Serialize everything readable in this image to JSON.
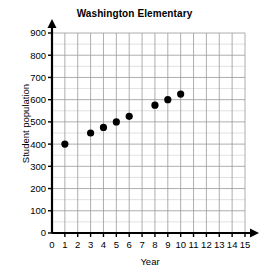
{
  "chart_data": {
    "type": "scatter",
    "title": "Washington Elementary",
    "xlabel": "Year",
    "ylabel": "Student population",
    "x": [
      1,
      3,
      4,
      5,
      6,
      8,
      9,
      10
    ],
    "values": [
      400,
      450,
      475,
      500,
      525,
      575,
      600,
      625
    ],
    "points": [
      {
        "x": 1,
        "y": 400
      },
      {
        "x": 3,
        "y": 450
      },
      {
        "x": 4,
        "y": 475
      },
      {
        "x": 5,
        "y": 500
      },
      {
        "x": 6,
        "y": 525
      },
      {
        "x": 8,
        "y": 575
      },
      {
        "x": 9,
        "y": 600
      },
      {
        "x": 10,
        "y": 625
      }
    ],
    "xlim": [
      0,
      15
    ],
    "ylim": [
      0,
      900
    ],
    "x_ticks": [
      0,
      1,
      2,
      3,
      4,
      5,
      6,
      7,
      8,
      9,
      10,
      11,
      12,
      13,
      14,
      15
    ],
    "y_ticks": [
      0,
      100,
      200,
      300,
      400,
      500,
      600,
      700,
      800,
      900
    ],
    "x_tick_labels": [
      "0",
      "1",
      "2",
      "3",
      "4",
      "5",
      "6",
      "7",
      "8",
      "9",
      "10",
      "11",
      "12",
      "13",
      "14",
      "15"
    ],
    "y_tick_labels": [
      "0",
      "100",
      "200",
      "300",
      "400",
      "500",
      "600",
      "700",
      "800",
      "900"
    ],
    "grid": true,
    "minor_grid_y_step": 50,
    "legend": null,
    "marker_color": "#000000",
    "grid_color": "#999999",
    "minor_grid_color": "#cccccc",
    "axis_color": "#000000",
    "background_color": "#ffffff"
  }
}
